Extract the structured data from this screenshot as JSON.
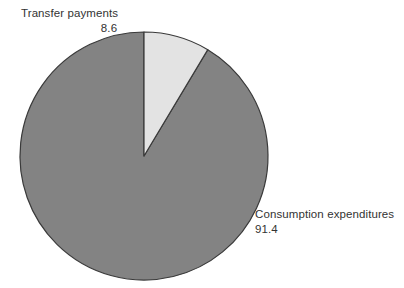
{
  "chart_data": {
    "type": "pie",
    "title": "",
    "subtitle": "",
    "xlabel": "",
    "ylabel": "",
    "legend_position": "none",
    "grid": false,
    "units": "percent",
    "total": 100.0,
    "start_angle_deg": 90,
    "direction": "counterclockwise",
    "categories": [
      "Transfer payments",
      "Consumption expenditures"
    ],
    "values": [
      8.6,
      91.4
    ],
    "slices": [
      {
        "label": "Transfer payments",
        "value": 8.6,
        "value_text": "8.6",
        "color": "#e3e3e3",
        "stroke": "#3a3a3a",
        "label_position": "outside-top-left"
      },
      {
        "label": "Consumption expenditures",
        "value": 91.4,
        "value_text": "91.4",
        "color": "#838383",
        "stroke": "#3a3a3a",
        "label_position": "outside-bottom-right"
      }
    ],
    "geometry": {
      "center_x": 144,
      "center_y": 156,
      "radius": 124
    }
  },
  "colors": {
    "background": "#ffffff",
    "slice_minor": "#e3e3e3",
    "slice_major": "#838383",
    "outline": "#3a3a3a",
    "text": "#333333"
  }
}
